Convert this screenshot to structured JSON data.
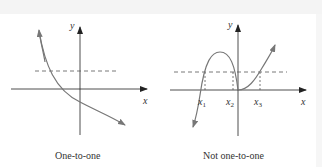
{
  "figures": [
    {
      "id": "left",
      "caption": "One-to-one",
      "axis_labels": {
        "x": "x",
        "y": "y"
      }
    },
    {
      "id": "right",
      "caption": "Not one-to-one",
      "axis_labels": {
        "x": "x",
        "y": "y"
      },
      "tick_labels": [
        {
          "base": "x",
          "sub": "1"
        },
        {
          "base": "x",
          "sub": "2"
        },
        {
          "base": "x",
          "sub": "3"
        }
      ]
    }
  ],
  "colors": {
    "axis": "#222222",
    "curve": "#777777",
    "dashed": "#555555",
    "text": "#333333"
  }
}
